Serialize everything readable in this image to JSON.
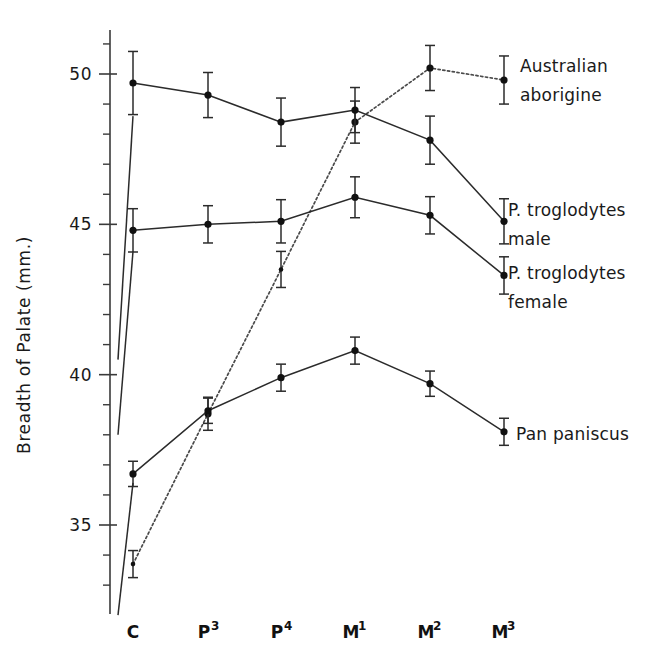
{
  "chart_data": {
    "type": "line",
    "title": "",
    "xlabel": "",
    "ylabel": "Breadth of Palate  (mm.)",
    "categories": [
      "C",
      "P3",
      "P4",
      "M1",
      "M2",
      "M3"
    ],
    "category_labels": [
      {
        "base": "C",
        "sup": ""
      },
      {
        "base": "P",
        "sup": "3"
      },
      {
        "base": "P",
        "sup": "4"
      },
      {
        "base": "M",
        "sup": "1"
      },
      {
        "base": "M",
        "sup": "2"
      },
      {
        "base": "M",
        "sup": "3"
      }
    ],
    "ylim": [
      31.5,
      51.2
    ],
    "ytick_major": [
      35,
      40,
      45,
      50
    ],
    "ytick_major_labels": [
      "35",
      "40",
      "45",
      "50"
    ],
    "ytick_minor_step": 1,
    "grid": false,
    "legend_position": "right-inline",
    "series": [
      {
        "name": "Australian aborigine",
        "style": "dotted",
        "label_lines": [
          "Australian",
          "aborigine"
        ],
        "x": [
          "C",
          "P3",
          "P4",
          "M1",
          "M2",
          "M3"
        ],
        "values": [
          33.7,
          38.7,
          43.5,
          48.4,
          50.2,
          49.8
        ],
        "errors": [
          0.45,
          0.55,
          0.6,
          0.7,
          0.75,
          0.8
        ],
        "visible_points": [
          "C",
          "P3",
          "P4",
          "M1",
          "M2",
          "M3"
        ]
      },
      {
        "name": "P. troglodytes male",
        "style": "solid",
        "label_lines": [
          "P. troglodytes",
          "male"
        ],
        "x": [
          "C",
          "P3",
          "P4",
          "M1",
          "M2",
          "M3"
        ],
        "values": [
          49.7,
          49.3,
          48.4,
          48.8,
          47.8,
          45.1
        ],
        "errors": [
          1.05,
          0.75,
          0.8,
          0.75,
          0.8,
          0.75
        ]
      },
      {
        "name": "P. troglodytes female",
        "style": "solid",
        "label_lines": [
          "P. troglodytes",
          "female"
        ],
        "x": [
          "C",
          "P3",
          "P4",
          "M1",
          "M2",
          "M3"
        ],
        "values": [
          44.8,
          45.0,
          45.1,
          45.9,
          45.3,
          43.3
        ],
        "errors": [
          0.72,
          0.62,
          0.72,
          0.68,
          0.62,
          0.62
        ]
      },
      {
        "name": "Pan paniscus",
        "style": "solid",
        "label_lines": [
          "Pan paniscus"
        ],
        "x": [
          "C",
          "P3",
          "P4",
          "M1",
          "M2",
          "M3"
        ],
        "values": [
          36.7,
          38.8,
          39.9,
          40.8,
          39.7,
          38.1
        ],
        "errors": [
          0.42,
          0.42,
          0.45,
          0.45,
          0.42,
          0.45
        ]
      }
    ],
    "stub_lines": [
      {
        "name": "stub-troglodytes-male",
        "from_value": 40.5,
        "to_value": 48.6
      },
      {
        "name": "stub-troglodytes-female",
        "from_value": 38.0,
        "to_value": 44.1
      },
      {
        "name": "stub-pan-paniscus",
        "from_value": 32.0,
        "to_value": 36.4
      }
    ]
  },
  "legend": {
    "australian_aborigine": [
      "Australian",
      "aborigine"
    ],
    "troglodytes_male": [
      "P. troglodytes",
      "male"
    ],
    "troglodytes_female": [
      "P. troglodytes",
      "female"
    ],
    "pan_paniscus": [
      "Pan paniscus"
    ]
  },
  "axis": {
    "y_title": "Breadth of Palate  (mm.)",
    "y_labels": [
      "50",
      "45",
      "40",
      "35"
    ],
    "x_labels": [
      "C",
      "P3",
      "P4",
      "M1",
      "M2",
      "M3"
    ]
  }
}
